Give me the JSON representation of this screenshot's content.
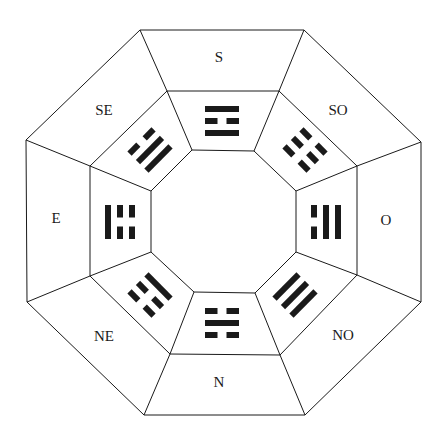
{
  "diagram": {
    "type": "bagua",
    "line_color": "#1a1a1a",
    "background": "#ffffff",
    "outer_ring": [
      [
        140,
        30
      ],
      [
        304,
        30
      ],
      [
        421,
        142
      ],
      [
        421,
        302
      ],
      [
        305,
        415
      ],
      [
        144,
        415
      ],
      [
        27,
        302
      ],
      [
        26,
        140
      ]
    ],
    "middle_ring": [
      [
        167,
        91
      ],
      [
        279,
        91
      ],
      [
        357,
        166
      ],
      [
        357,
        275
      ],
      [
        280,
        355
      ],
      [
        170,
        354
      ],
      [
        90,
        276
      ],
      [
        90,
        166
      ]
    ],
    "inner_ring": [
      [
        192,
        150
      ],
      [
        254,
        151
      ],
      [
        296,
        191
      ],
      [
        296,
        252
      ],
      [
        255,
        293
      ],
      [
        194,
        292
      ],
      [
        151,
        252
      ],
      [
        151,
        191
      ]
    ],
    "sectors": [
      {
        "direction": "S",
        "label": "S",
        "label_pos": [
          219,
          62
        ],
        "trigram_center": [
          222,
          121
        ],
        "angle": 0,
        "lines_outer_to_inner": [
          "solid",
          "broken",
          "solid"
        ]
      },
      {
        "direction": "SO",
        "label": "SO",
        "label_pos": [
          338,
          115
        ],
        "trigram_center": [
          305,
          150
        ],
        "angle": 45,
        "lines_outer_to_inner": [
          "broken",
          "broken",
          "broken"
        ]
      },
      {
        "direction": "O",
        "label": "O",
        "label_pos": [
          386,
          225
        ],
        "trigram_center": [
          326,
          222
        ],
        "angle": 90,
        "lines_outer_to_inner": [
          "solid",
          "solid",
          "broken"
        ]
      },
      {
        "direction": "NO",
        "label": "NO",
        "label_pos": [
          343,
          340
        ],
        "trigram_center": [
          295,
          295
        ],
        "angle": 135,
        "lines_outer_to_inner": [
          "solid",
          "solid",
          "solid"
        ]
      },
      {
        "direction": "N",
        "label": "N",
        "label_pos": [
          219,
          387
        ],
        "trigram_center": [
          222,
          323
        ],
        "angle": 180,
        "lines_outer_to_inner": [
          "broken",
          "solid",
          "broken"
        ]
      },
      {
        "direction": "NE",
        "label": "NE",
        "label_pos": [
          104,
          341
        ],
        "trigram_center": [
          150,
          295
        ],
        "angle": 225,
        "lines_outer_to_inner": [
          "broken",
          "broken",
          "solid"
        ]
      },
      {
        "direction": "E",
        "label": "E",
        "label_pos": [
          56,
          223
        ],
        "trigram_center": [
          120,
          222
        ],
        "angle": 270,
        "lines_outer_to_inner": [
          "solid",
          "broken",
          "broken"
        ]
      },
      {
        "direction": "SE",
        "label": "SE",
        "label_pos": [
          104,
          115
        ],
        "trigram_center": [
          150,
          150
        ],
        "angle": 315,
        "lines_outer_to_inner": [
          "broken",
          "solid",
          "solid"
        ]
      }
    ]
  }
}
